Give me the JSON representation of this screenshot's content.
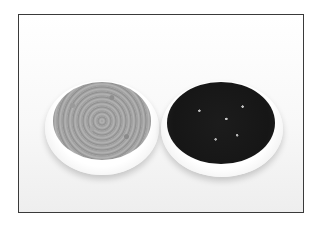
{
  "image": {
    "subject": "Two white plates of coffee beans on a white background",
    "items": [
      {
        "label": "green-coffee-beans-plate",
        "tone": "#a0a0a0"
      },
      {
        "label": "roasted-coffee-beans-plate",
        "tone": "#1a1a1a"
      }
    ],
    "frame_color": "#3a3a3a",
    "background": "#fafafa"
  }
}
